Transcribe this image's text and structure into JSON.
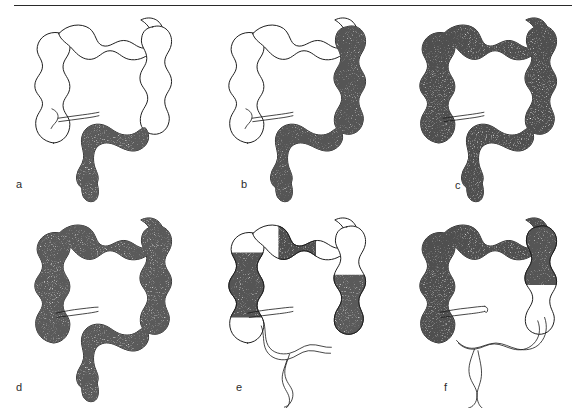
{
  "figure": {
    "panel_count": 6,
    "rows": 2,
    "columns": 3,
    "top_rule": true,
    "ink_color": "#1b1b1b",
    "background_color": "#ffffff",
    "stipple_color": "#1a1a1a",
    "diseased_fill_label": "stippled",
    "normal_fill_label": "unshaded"
  },
  "panels": [
    {
      "id": "a",
      "label": "a",
      "position": "top-left",
      "diseased_segments": [
        "sigmoid colon",
        "rectum"
      ],
      "normal_segments": [
        "cecum",
        "ascending colon",
        "transverse colon",
        "descending colon"
      ],
      "terminal_ileum_shown": true,
      "small_bowel_shown": false,
      "continuous": true
    },
    {
      "id": "b",
      "label": "b",
      "position": "top-center",
      "diseased_segments": [
        "splenic flexure",
        "descending colon",
        "sigmoid colon",
        "rectum"
      ],
      "normal_segments": [
        "cecum",
        "ascending colon",
        "transverse colon"
      ],
      "terminal_ileum_shown": true,
      "small_bowel_shown": false,
      "continuous": true
    },
    {
      "id": "c",
      "label": "c",
      "position": "top-right",
      "diseased_segments": [
        "cecum",
        "ascending colon",
        "transverse colon",
        "descending colon",
        "sigmoid colon",
        "rectum"
      ],
      "normal_segments": [],
      "terminal_ileum_shown": true,
      "small_bowel_shown": false,
      "continuous": true
    },
    {
      "id": "d",
      "label": "d",
      "position": "bottom-left",
      "diseased_segments": [
        "cecum",
        "ascending colon",
        "transverse colon",
        "descending colon",
        "sigmoid colon",
        "rectum"
      ],
      "normal_segments": [],
      "terminal_ileum_shown": true,
      "small_bowel_shown": false,
      "continuous": true
    },
    {
      "id": "e",
      "label": "e",
      "position": "bottom-center",
      "diseased_segments": [
        "ascending colon",
        "mid transverse colon",
        "descending colon"
      ],
      "normal_segments": [
        "cecum",
        "hepatic flexure",
        "splenic flexure",
        "sigmoid colon",
        "rectum"
      ],
      "terminal_ileum_shown": true,
      "small_bowel_shown": true,
      "continuous": false,
      "pattern": "skip lesions"
    },
    {
      "id": "f",
      "label": "f",
      "position": "bottom-right",
      "diseased_segments": [
        "cecum",
        "ascending colon",
        "transverse colon",
        "splenic flexure"
      ],
      "normal_segments": [
        "descending colon",
        "sigmoid colon",
        "rectum"
      ],
      "terminal_ileum_shown": true,
      "small_bowel_shown": true,
      "continuous": true
    }
  ]
}
